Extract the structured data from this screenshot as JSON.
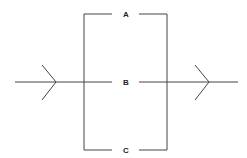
{
  "diagram": {
    "type": "parallel-paths",
    "labels": {
      "a": "A",
      "b": "B",
      "c": "C"
    },
    "line_color": "#444444"
  }
}
